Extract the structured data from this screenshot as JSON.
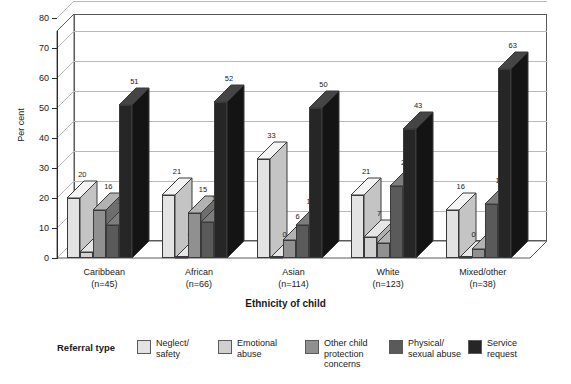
{
  "chart_data": {
    "type": "bar",
    "title": "",
    "subtitle": "",
    "xlabel": "Ethnicity of child",
    "ylabel": "Per cent",
    "ylim": [
      0,
      80
    ],
    "ytick_step": 10,
    "yticks": [
      0,
      10,
      20,
      30,
      40,
      50,
      60,
      70,
      80
    ],
    "grid": true,
    "three_d": true,
    "legend_position": "bottom",
    "legend_title": "Referral type",
    "categories": [
      "Caribbean",
      "African",
      "Asian",
      "White",
      "Mixed/other"
    ],
    "category_sublabels": [
      "(n=45)",
      "(n=66)",
      "(n=114)",
      "(n=123)",
      "(n=38)"
    ],
    "series": [
      {
        "name": "Neglect/\nsafety",
        "color": "#e3e3e3",
        "top_color": "#f4f4f4",
        "side_color": "#c4c4c4",
        "values": [
          20,
          21,
          33,
          21,
          16
        ]
      },
      {
        "name": "Emotional\nabuse",
        "color": "#d0d0d0",
        "top_color": "#e6e6e6",
        "side_color": "#b0b0b0",
        "values": [
          2,
          0,
          0,
          7,
          0
        ]
      },
      {
        "name": "Other child\nprotection\nconcerns",
        "color": "#909090",
        "top_color": "#b2b2b2",
        "side_color": "#6e6e6e",
        "values": [
          16,
          15,
          6,
          5,
          3
        ]
      },
      {
        "name": "Physical/\nsexual abuse",
        "color": "#5a5a5a",
        "top_color": "#7d7d7d",
        "side_color": "#3f3f3f",
        "values": [
          11,
          12,
          11,
          24,
          18
        ]
      },
      {
        "name": "Service\nrequest",
        "color": "#262626",
        "top_color": "#454545",
        "side_color": "#141414",
        "values": [
          51,
          52,
          50,
          43,
          63
        ]
      }
    ]
  },
  "axis": {
    "y_title": "Per cent",
    "x_title": "Ethnicity of child"
  },
  "legend": {
    "title": "Referral type"
  }
}
